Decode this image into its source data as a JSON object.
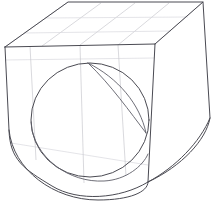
{
  "figure": {
    "caption": "",
    "background_color": "#ffffff",
    "outline_color": "#4a4a52",
    "grid_color": "#c9c9cf",
    "width": 220,
    "height": 206
  },
  "geometry": {
    "top_face": {
      "name": "top-face",
      "points": "5,47 68,2 203,2 155,44"
    },
    "front_face": {
      "name": "front-face",
      "points": "5,47 155,44 148,182 13,148"
    },
    "side_face": {
      "name": "right-side-face",
      "points": "155,44 203,2 210,118 148,182"
    },
    "body_outline": "M5,47 L68,2 L203,2 L210,118 C206,140 182,166 148,182 C120,199 78,202 52,186 C24,169 10,160 9,130 L5,47 Z",
    "front_silhouette": "M5,47 L155,44 L148,182",
    "bore_outer_circle": {
      "name": "bore-front-circle",
      "cx": 90,
      "cy": 120,
      "rx": 59,
      "ry": 57
    },
    "bore_inner_arc": "M88,63 C118,78 140,104 146,133",
    "bore_inner_arc_back": "M88,63 C111,85 130,112 146,133",
    "outer_bottom_arc": "M9,130 C13,170 54,200 98,200 C130,200 148,192 148,182",
    "inner_bottom_arc": "M31,122 C33,158 70,183 104,181 C126,180 143,166 148,154"
  },
  "grid_lines": {
    "top_face_longitudinal": [
      "M5,47 L68,2",
      "M42,46 L101,3",
      "M80,45 L135,3",
      "M118,45 L169,3",
      "M155,44 L203,2"
    ],
    "top_face_transverse": [
      "M68,2 L203,2",
      "M45,18 L188,17",
      "M24,33 L171,31",
      "M5,47 L155,44"
    ],
    "front_face_horizontal": [
      "M5,60 L154,58",
      "M11,143 L148,165"
    ],
    "front_face_vertical": [
      "M30,46 L36,160",
      "M80,45 L84,183",
      "M118,45 L126,176"
    ]
  },
  "labels": {
    "annotations": []
  }
}
